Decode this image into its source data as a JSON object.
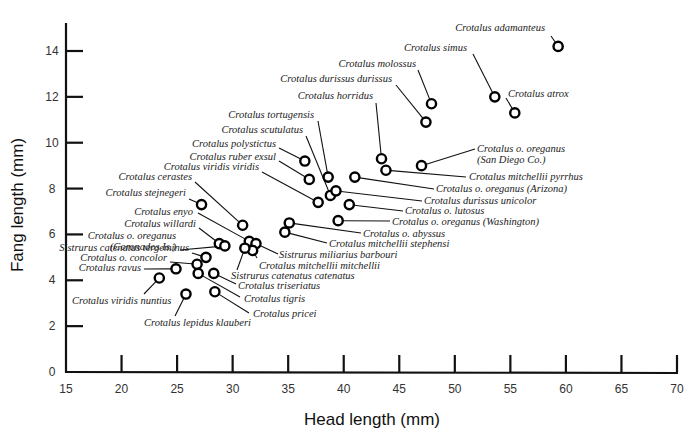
{
  "chart_data": {
    "type": "scatter",
    "title": "",
    "xlabel": "Head length (mm)",
    "ylabel": "Fang length (mm)",
    "xlim": [
      15,
      70
    ],
    "ylim": [
      0,
      15
    ],
    "x_ticks": [
      15,
      20,
      25,
      30,
      35,
      40,
      45,
      50,
      55,
      60,
      65,
      70
    ],
    "y_ticks": [
      0,
      2,
      4,
      6,
      8,
      10,
      12,
      14
    ],
    "grid": false,
    "legend": null,
    "marker": "open-circle",
    "points": [
      {
        "label": "Crotalus adamanteus",
        "x": 59.3,
        "y": 14.2,
        "lx": 545,
        "ly": 31,
        "anchor": "end",
        "ex": 551,
        "ey": 36
      },
      {
        "label": "Crotalus simus",
        "x": 53.6,
        "y": 12.0,
        "lx": 467,
        "ly": 51,
        "anchor": "end",
        "ex": 473,
        "ey": 54
      },
      {
        "label": "Crotalus molossus",
        "x": 47.9,
        "y": 11.7,
        "lx": 416,
        "ly": 67,
        "anchor": "end",
        "ex": 418,
        "ey": 70
      },
      {
        "label": "Crotalus atrox",
        "x": 55.4,
        "y": 11.3,
        "lx": 508,
        "ly": 97,
        "anchor": "start",
        "ex": 506,
        "ey": 98
      },
      {
        "label": "Crotalus durissus durissus",
        "x": 47.4,
        "y": 10.9,
        "lx": 392,
        "ly": 82,
        "anchor": "end",
        "ex": 396,
        "ey": 85
      },
      {
        "label": "Crotalus horridus",
        "x": 43.4,
        "y": 9.3,
        "lx": 373,
        "ly": 99,
        "anchor": "end",
        "ex": 376,
        "ey": 103
      },
      {
        "label": "Crotalus o. oreganus\n(San Diego Co.)",
        "x": 47.0,
        "y": 9.0,
        "lx": 477,
        "ly": 152,
        "anchor": "start",
        "ex": 475,
        "ey": 149
      },
      {
        "label": "Crotalus tortugensis",
        "x": 38.6,
        "y": 8.5,
        "lx": 314,
        "ly": 118,
        "anchor": "end",
        "ex": 318,
        "ey": 121
      },
      {
        "label": "Crotalus scutulatus",
        "x": 38.8,
        "y": 7.7,
        "lx": 303,
        "ly": 133,
        "anchor": "end",
        "ex": 306,
        "ey": 136
      },
      {
        "label": "Crotalus polystictus",
        "x": 36.5,
        "y": 9.2,
        "lx": 276,
        "ly": 147,
        "anchor": "end",
        "ex": 279,
        "ey": 148
      },
      {
        "label": "Crotalus ruber exsul",
        "x": 36.9,
        "y": 8.4,
        "lx": 276,
        "ly": 160,
        "anchor": "end",
        "ex": 279,
        "ey": 161
      },
      {
        "label": "Crotalus viridis viridis",
        "x": 37.7,
        "y": 7.4,
        "lx": 259,
        "ly": 170,
        "anchor": "end",
        "ex": 262,
        "ey": 172
      },
      {
        "label": "Crotalus mitchellii pyrrhus",
        "x": 43.8,
        "y": 8.8,
        "lx": 469,
        "ly": 180,
        "anchor": "start",
        "ex": 466,
        "ey": 177
      },
      {
        "label": "Crotalus o. oreganus (Arizona)",
        "x": 41.0,
        "y": 8.5,
        "lx": 436,
        "ly": 192,
        "anchor": "start",
        "ex": 434,
        "ey": 189
      },
      {
        "label": "Crotalus durissus unicolor",
        "x": 39.3,
        "y": 7.9,
        "lx": 424,
        "ly": 204,
        "anchor": "start",
        "ex": 422,
        "ey": 201
      },
      {
        "label": "Crotalus o. lutosus",
        "x": 40.5,
        "y": 7.3,
        "lx": 405,
        "ly": 214,
        "anchor": "start",
        "ex": 403,
        "ey": 211
      },
      {
        "label": "Crotalus o. oreganus (Washington)",
        "x": 39.5,
        "y": 6.6,
        "lx": 392,
        "ly": 225,
        "anchor": "start",
        "ex": 390,
        "ey": 221
      },
      {
        "label": "Crotalus o. abyssus",
        "x": 35.1,
        "y": 6.5,
        "lx": 363,
        "ly": 237,
        "anchor": "start",
        "ex": 361,
        "ey": 233
      },
      {
        "label": "Crotalus mitchellii stephensi",
        "x": 34.7,
        "y": 6.1,
        "lx": 329,
        "ly": 247,
        "anchor": "start",
        "ex": 327,
        "ey": 243
      },
      {
        "label": "Crotalus cerastes",
        "x": 30.9,
        "y": 6.4,
        "lx": 192,
        "ly": 180,
        "anchor": "end",
        "ex": 195,
        "ey": 182
      },
      {
        "label": "Crotalus stejnegeri",
        "x": 27.2,
        "y": 7.3,
        "lx": 186,
        "ly": 196,
        "anchor": "end",
        "ex": 189,
        "ey": 199
      },
      {
        "label": "Crotalus enyo",
        "x": 31.5,
        "y": 5.7,
        "lx": 193,
        "ly": 215,
        "anchor": "end",
        "ex": 198,
        "ey": 213
      },
      {
        "label": "Crotalus willardi",
        "x": 28.8,
        "y": 5.6,
        "lx": 196,
        "ly": 227,
        "anchor": "end",
        "ex": 199,
        "ey": 228
      },
      {
        "label": "Crotalus o. oreganus\n(Coronados Is.)",
        "x": 29.3,
        "y": 5.5,
        "lx": 176,
        "ly": 239,
        "anchor": "end",
        "ex": 180,
        "ey": 250
      },
      {
        "label": "Sistrurus miliarius barbouri",
        "x": 32.1,
        "y": 5.6,
        "lx": 279,
        "ly": 258,
        "anchor": "start",
        "ex": 278,
        "ey": 254
      },
      {
        "label": "Crotalus mitchellii mitchellii",
        "x": 31.8,
        "y": 5.3,
        "lx": 259,
        "ly": 269,
        "anchor": "start",
        "ex": 257,
        "ey": 258
      },
      {
        "label": "Sistrurus catenatus catenatus",
        "x": 31.1,
        "y": 5.4,
        "lx": 231,
        "ly": 279,
        "anchor": "start",
        "ex": 237,
        "ey": 270
      },
      {
        "label": "Sistrurus catenatus tergeminus",
        "x": 27.6,
        "y": 5.0,
        "lx": 189,
        "ly": 251,
        "anchor": "end",
        "ex": 192,
        "ey": 253
      },
      {
        "label": "Crotalus o. concolor",
        "x": 26.8,
        "y": 4.7,
        "lx": 167,
        "ly": 261,
        "anchor": "end",
        "ex": 170,
        "ey": 262
      },
      {
        "label": "Crotalus ravus",
        "x": 24.9,
        "y": 4.5,
        "lx": 141,
        "ly": 271,
        "anchor": "end",
        "ex": 144,
        "ey": 269
      },
      {
        "label": "Crotalus triseriatus",
        "x": 28.3,
        "y": 4.3,
        "lx": 238,
        "ly": 289,
        "anchor": "start",
        "ex": 236,
        "ey": 284
      },
      {
        "label": "Crotalus tigris",
        "x": 26.9,
        "y": 4.3,
        "lx": 244,
        "ly": 302,
        "anchor": "start",
        "ex": 240,
        "ey": 297
      },
      {
        "label": "Crotalus pricei",
        "x": 28.4,
        "y": 3.5,
        "lx": 253,
        "ly": 317,
        "anchor": "start",
        "ex": 249,
        "ey": 313
      },
      {
        "label": "Crotalus viridis nuntius",
        "x": 23.4,
        "y": 4.1,
        "lx": 72,
        "ly": 304,
        "anchor": "start",
        "ex": 144,
        "ey": 294
      },
      {
        "label": "Crotalus lepidus klauberi",
        "x": 25.8,
        "y": 3.4,
        "lx": 144,
        "ly": 326,
        "anchor": "start",
        "ex": 175,
        "ey": 316
      }
    ]
  }
}
